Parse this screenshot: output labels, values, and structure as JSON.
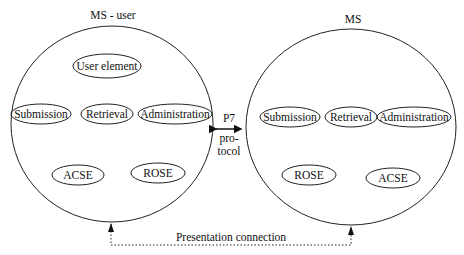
{
  "left_entity": {
    "title": "MS - user",
    "elements": {
      "user_element": "User element",
      "submission": "Submission",
      "retrieval": "Retrieval",
      "administration": "Administration",
      "acse": "ACSE",
      "rose": "ROSE"
    }
  },
  "right_entity": {
    "title": "MS",
    "elements": {
      "submission": "Submission",
      "retrieval": "Retrieval",
      "administration": "Administration",
      "rose": "ROSE",
      "acse": "ACSE"
    }
  },
  "protocol": {
    "line1": "P7",
    "line2": "pro-",
    "line3": "tocol"
  },
  "connection": {
    "label": "Presentation connection"
  }
}
